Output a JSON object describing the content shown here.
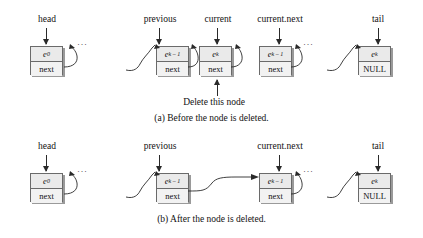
{
  "figure": {
    "panels": [
      {
        "id": "a",
        "caption": "(a) Before the node is deleted.",
        "annotation": "Delete this node",
        "pointers": [
          {
            "label": "head"
          },
          {
            "label": "previous"
          },
          {
            "label": "current"
          },
          {
            "label": "current.next"
          },
          {
            "label": "tail"
          }
        ],
        "nodes": [
          {
            "name": "head-node",
            "element": "e",
            "subscript": "0",
            "link": "next"
          },
          {
            "name": "previous-node",
            "element": "e",
            "subscript": "k – 1",
            "link": "next"
          },
          {
            "name": "current-node",
            "element": "e",
            "subscript": "k",
            "link": "next"
          },
          {
            "name": "current-next-node",
            "element": "e",
            "subscript": "k – 1",
            "link": "next"
          },
          {
            "name": "tail-node",
            "element": "e",
            "subscript": "k",
            "link": "NULL"
          }
        ],
        "ellipsis": "···"
      },
      {
        "id": "b",
        "caption": "(b) After the node is deleted.",
        "annotation": "",
        "pointers": [
          {
            "label": "head"
          },
          {
            "label": "previous"
          },
          {
            "label": "current.next"
          },
          {
            "label": "tail"
          }
        ],
        "nodes": [
          {
            "name": "head-node",
            "element": "e",
            "subscript": "0",
            "link": "next"
          },
          {
            "name": "previous-node",
            "element": "e",
            "subscript": "k – 1",
            "link": "next"
          },
          {
            "name": "current-next-node",
            "element": "e",
            "subscript": "k – 1",
            "link": "next"
          },
          {
            "name": "tail-node",
            "element": "e",
            "subscript": "k",
            "link": "NULL"
          }
        ],
        "ellipsis": "···"
      }
    ],
    "colors": {
      "node_fill": "#eaeaea",
      "node_link_fill": "#f2f2f2",
      "node_border": "#6a6a6a",
      "node_shadow": "#9a9a9a",
      "line": "#2a2a2a",
      "text": "#111111",
      "background": "#ffffff"
    }
  }
}
